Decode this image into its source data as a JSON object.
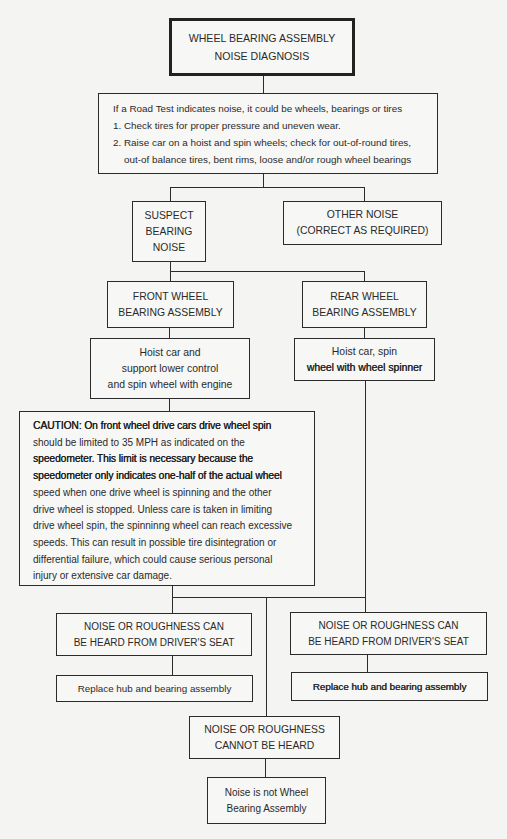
{
  "diagram": {
    "title": {
      "lines": [
        "WHEEL BEARING ASSEMBLY",
        "NOISE DIAGNOSIS"
      ]
    },
    "road_test": {
      "lines": [
        "If a Road Test indicates noise, it could be wheels, bearings or tires",
        "1. Check tires for proper pressure and uneven wear.",
        "2. Raise car on a hoist and spin wheels; check for out-of-round tires,",
        "out-of balance tires, bent rims, loose and/or rough wheel bearings"
      ]
    },
    "suspect": {
      "lines": [
        "SUSPECT",
        "BEARING",
        "NOISE"
      ]
    },
    "other_noise": {
      "lines": [
        "OTHER NOISE",
        "(CORRECT AS REQUIRED)"
      ]
    },
    "front_wheel": {
      "lines": [
        "FRONT WHEEL",
        "BEARING ASSEMBLY"
      ]
    },
    "rear_wheel": {
      "lines": [
        "REAR WHEEL",
        "BEARING ASSEMBLY"
      ]
    },
    "front_hoist": {
      "lines": [
        "Hoist car and",
        "support lower control",
        "and spin wheel with engine"
      ]
    },
    "rear_hoist": {
      "lines": [
        "Hoist  car, spin",
        "wheel with wheel spinner"
      ]
    },
    "caution": {
      "lines": [
        "CAUTION: On front wheel drive cars drive wheel spin",
        "should be limited to 35 MPH as indicated on the",
        "speedometer. This limit is necessary because the",
        "speedometer only indicates one-half of the actual wheel",
        "speed when one drive wheel is spinning and the other",
        "drive wheel is stopped. Unless care is taken in limiting",
        "drive wheel spin, the spinninng wheel can reach excessive",
        "speeds. This can result in possible tire disintegration or",
        "differential failure, which could cause serious personal",
        "injury or extensive car damage."
      ]
    },
    "left_heard": {
      "lines": [
        "NOISE OR ROUGHNESS CAN",
        "BE HEARD FROM DRIVER'S SEAT"
      ]
    },
    "right_heard": {
      "lines": [
        "NOISE OR ROUGHNESS CAN",
        "BE HEARD FROM DRIVER'S SEAT"
      ]
    },
    "left_replace": {
      "lines": [
        "Replace hub and bearing assembly"
      ]
    },
    "right_replace": {
      "lines": [
        "Replace hub and bearing assembly"
      ]
    },
    "cannot_hear": {
      "lines": [
        "NOISE OR ROUGHNESS",
        "CANNOT BE HEARD"
      ]
    },
    "not_wheel": {
      "lines": [
        "Noise is not Wheel",
        "Bearing Assembly"
      ]
    }
  }
}
